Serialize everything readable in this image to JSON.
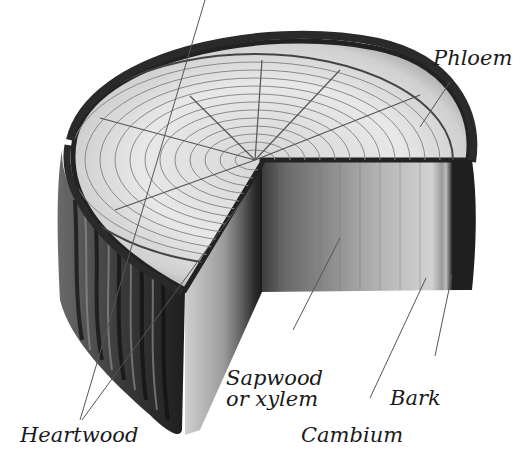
{
  "diagram": {
    "labels": {
      "phloem": "Phloem",
      "sapwood_line1": "Sapwood",
      "sapwood_line2": "or xylem",
      "bark": "Bark",
      "heartwood": "Heartwood",
      "cambium": "Cambium"
    },
    "colors": {
      "background": "#ffffff",
      "label_text": "#1a1a1a",
      "leader_line": "#555555",
      "bark_dark": "#2a2a2a",
      "wood_light": "#dcdcdc",
      "wood_mid": "#a8a8a8"
    }
  }
}
